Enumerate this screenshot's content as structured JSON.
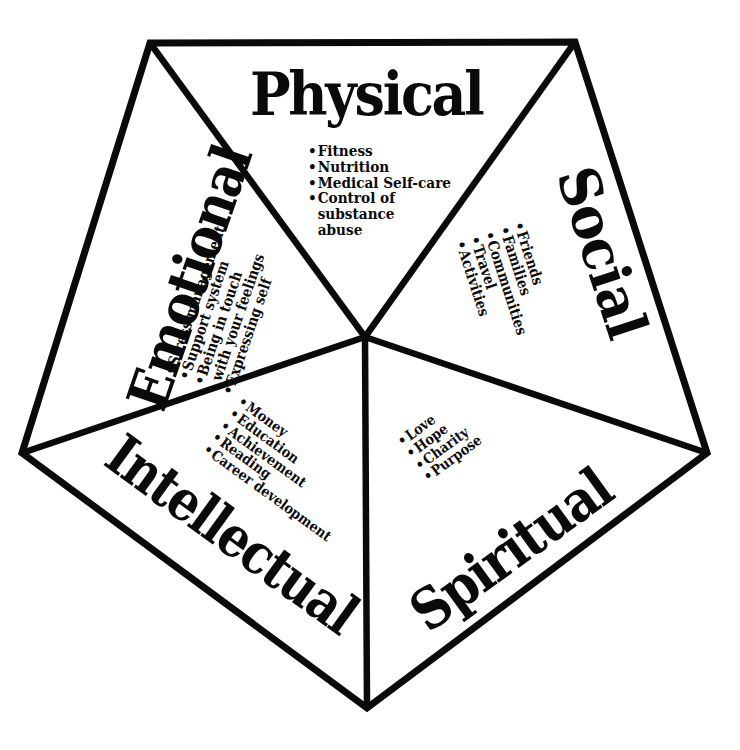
{
  "diagram": {
    "type": "wellness-pentagon",
    "colors": {
      "stroke": "#0a0a0a",
      "background": "#ffffff",
      "text": "#0a0a0a"
    },
    "bullet": "•",
    "sections": {
      "physical": {
        "title": "Physical",
        "items": [
          {
            "text": "Fitness"
          },
          {
            "text": "Nutrition"
          },
          {
            "text": "Medical Self-care"
          },
          {
            "text": "Control of",
            "cont": [
              "substance",
              "abuse"
            ]
          }
        ]
      },
      "emotional": {
        "title": "Emotional",
        "items": [
          {
            "text": "Stress management"
          },
          {
            "text": "Support system"
          },
          {
            "text": "Being in touch",
            "cont": [
              "with your feelings"
            ]
          },
          {
            "text": "Expressing self"
          }
        ]
      },
      "social": {
        "title": "Social",
        "items": [
          {
            "text": "Friends"
          },
          {
            "text": "Families"
          },
          {
            "text": "Communities"
          },
          {
            "text": "Travel"
          },
          {
            "text": "Activities"
          }
        ]
      },
      "intellectual": {
        "title": "Intellectual",
        "items": [
          {
            "text": "Money"
          },
          {
            "text": "Education"
          },
          {
            "text": "Achievement"
          },
          {
            "text": "Reading"
          },
          {
            "text": "Career development"
          }
        ]
      },
      "spiritual": {
        "title": "Spiritual",
        "items": [
          {
            "text": "Love"
          },
          {
            "text": "Hope"
          },
          {
            "text": "Charity"
          },
          {
            "text": "Purpose"
          }
        ]
      }
    }
  }
}
